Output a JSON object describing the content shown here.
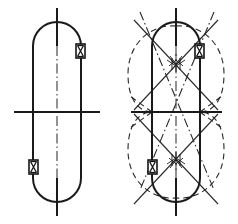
{
  "figure": {
    "type": "engineering-line-drawing",
    "background_color": "#ffffff",
    "line_color": "#1a1a1a",
    "dashed_line_color": "#2a2a2a",
    "canvas": {
      "width": 238,
      "height": 224
    }
  },
  "panels": [
    {
      "id": "left-panel",
      "name": "plain-stadium-view",
      "label": "",
      "center_x": 57,
      "center_y": 112,
      "stadium": {
        "left_x": 33,
        "right_x": 81,
        "top_y": 22,
        "bottom_y": 202,
        "radius": 24,
        "straight_top_y": 46,
        "straight_bottom_y": 178
      },
      "vertical_centerline": {
        "x": 57,
        "y1": 8,
        "y2": 216
      },
      "horizontal_axis": {
        "y": 112,
        "x1": 14,
        "x2": 100
      },
      "markers": [
        {
          "name": "marker-upper-right",
          "x": 76,
          "y": 51,
          "w": 9,
          "h": 14,
          "glyph": "hourglass-x"
        },
        {
          "name": "marker-lower-left",
          "x": 29,
          "y": 166,
          "w": 9,
          "h": 14,
          "glyph": "hourglass-x"
        }
      ]
    },
    {
      "id": "right-panel",
      "name": "stadium-with-construction-geometry",
      "label": "",
      "center_x": 176,
      "center_y": 112,
      "stadium": {
        "left_x": 152,
        "right_x": 200,
        "top_y": 22,
        "bottom_y": 202,
        "radius": 24,
        "straight_top_y": 46,
        "straight_bottom_y": 178
      },
      "vertical_centerline": {
        "x": 176,
        "y1": 8,
        "y2": 216
      },
      "horizontal_axis": {
        "y": 112,
        "x1": 131,
        "x2": 222
      },
      "outer_envelope": {
        "name": "dashed-teardrop-envelope",
        "description": "pair of mirrored dashed lobes enclosing the stadium"
      },
      "ray_bundles": [
        {
          "name": "upper-convergence-cluster",
          "x": 176,
          "y": 62
        },
        {
          "name": "lower-convergence-cluster",
          "x": 176,
          "y": 162
        }
      ],
      "markers": [
        {
          "name": "marker-upper-right",
          "x": 195,
          "y": 51,
          "w": 9,
          "h": 14,
          "glyph": "hourglass-x"
        },
        {
          "name": "marker-lower-left",
          "x": 148,
          "y": 166,
          "w": 9,
          "h": 14,
          "glyph": "hourglass-x"
        }
      ]
    }
  ]
}
